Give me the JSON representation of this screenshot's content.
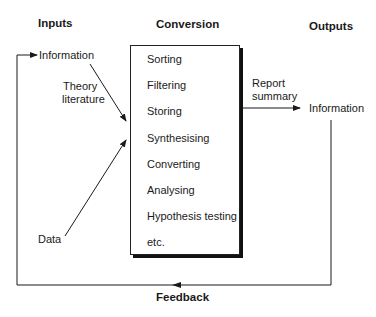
{
  "headings": {
    "inputs": "Inputs",
    "conversion": "Conversion",
    "outputs": "Outputs"
  },
  "inputs": {
    "information": "Information",
    "theory_literature_line1": "Theory",
    "theory_literature_line2": "literature",
    "data": "Data"
  },
  "conversion": {
    "items": [
      "Sorting",
      "Filtering",
      "Storing",
      "Synthesising",
      "Converting",
      "Analysing",
      "Hypothesis testing",
      "etc."
    ]
  },
  "outputs": {
    "report_summary_line1": "Report",
    "report_summary_line2": "summary",
    "information": "Information"
  },
  "feedback": {
    "label": "Feedback"
  },
  "colors": {
    "line": "#1a1a1a",
    "background": "#ffffff"
  }
}
